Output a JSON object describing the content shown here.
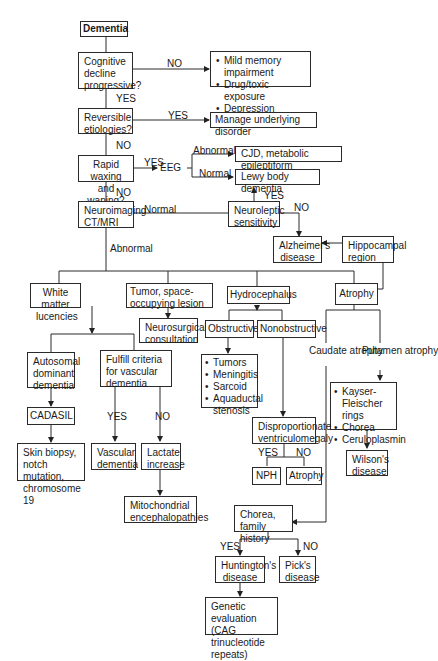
{
  "title": "Dementia",
  "nodes": {
    "dementia": "Dementia",
    "cognitive": "Cognitive decline progressive?",
    "mild_list": [
      "Mild memory impairment",
      "Drug/toxic exposure",
      "Depression"
    ],
    "reversible": "Reversible etiologies?",
    "manage": "Manage underlying disorder",
    "rapid": "Rapid waxing and waning?",
    "eeg": "EEG",
    "cjd": "CJD, metabolic epileptiform",
    "lewy": "Lewy body dementia",
    "neuroimaging": "Neuroimaging CT/MRI",
    "neuroleptic": "Neuroleptic sensitivity",
    "alzheimers": "Alzheimer's disease",
    "hippocampal": "Hippocampal region",
    "white_matter": "White matter lucencies",
    "tumor": "Tumor, space-occupying lesion",
    "neurosurgical": "Neurosurgical consultation",
    "hydrocephalus": "Hydrocephalus",
    "atrophy": "Atrophy",
    "obstructive": "Obstructive",
    "nonobstructive": "Nonobstructive",
    "obstructive_list": [
      "Tumors",
      "Meningitis",
      "Sarcoid",
      "Aquaductal stenosis"
    ],
    "disproportionate": "Disproportionate ventriculomegaly",
    "nph": "NPH",
    "atrophy2": "Atrophy",
    "caudate": "Caudate atrophy",
    "putamen": "Putamen atrophy",
    "putamen_list": [
      "Kayser-Fleischer rings",
      "Chorea",
      "Ceruloplasmin"
    ],
    "wilsons": "Wilson's disease",
    "autosomal": "Autosomal dominant dementia",
    "fulfill": "Fulfill criteria for vascular dementia",
    "cadasil": "CADASIL",
    "skin": "Skin biopsy, notch mutation, chromosome 19",
    "vascular": "Vascular dementia",
    "lactate": "Lactate increase",
    "mito": "Mitochondrial encephalopathies",
    "chorea": "Chorea, family history",
    "huntington": "Huntington's disease",
    "picks": "Pick's disease",
    "genetic": "Genetic evaluation (CAG trinucleotide repeats)"
  },
  "edge_labels": {
    "cog_no": "NO",
    "cog_yes": "YES",
    "rev_yes": "YES",
    "rev_no": "NO",
    "rapid_yes": "YES",
    "rapid_no": "NO",
    "eeg_abnormal": "Abnormal",
    "eeg_normal": "Normal",
    "neuro_normal": "Normal",
    "neuro_abnormal": "Abnormal",
    "neurolep_yes": "YES",
    "neurolep_no": "NO",
    "fulfill_yes": "YES",
    "fulfill_no": "NO",
    "disp_yes": "YES",
    "disp_no": "NO",
    "chorea_yes": "YES",
    "chorea_no": "NO"
  }
}
